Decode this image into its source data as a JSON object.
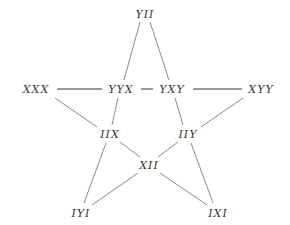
{
  "diagram": {
    "type": "star-graph",
    "nodes": [
      {
        "id": "YII",
        "label": "YII",
        "x": 145,
        "y": 14
      },
      {
        "id": "XXX",
        "label": "XXX",
        "x": 36,
        "y": 89
      },
      {
        "id": "YYX",
        "label": "YYX",
        "x": 121,
        "y": 89
      },
      {
        "id": "YXY",
        "label": "YXY",
        "x": 172,
        "y": 89
      },
      {
        "id": "XYY",
        "label": "XYY",
        "x": 261,
        "y": 89
      },
      {
        "id": "IIX",
        "label": "IIX",
        "x": 110,
        "y": 134
      },
      {
        "id": "IIY",
        "label": "IIY",
        "x": 188,
        "y": 134
      },
      {
        "id": "XII",
        "label": "XII",
        "x": 149,
        "y": 165
      },
      {
        "id": "IYI",
        "label": "IYI",
        "x": 81,
        "y": 213
      },
      {
        "id": "IXI",
        "label": "IXI",
        "x": 218,
        "y": 213
      }
    ],
    "edges": [
      {
        "from": "YII",
        "to": "YYX",
        "style": "thin"
      },
      {
        "from": "YII",
        "to": "YXY",
        "style": "thin"
      },
      {
        "from": "XXX",
        "to": "YYX",
        "style": "thick"
      },
      {
        "from": "YYX",
        "to": "YXY",
        "style": "thick"
      },
      {
        "from": "YXY",
        "to": "XYY",
        "style": "thick"
      },
      {
        "from": "YYX",
        "to": "IIX",
        "style": "thin"
      },
      {
        "from": "YXY",
        "to": "IIY",
        "style": "thin"
      },
      {
        "from": "XXX",
        "to": "IIX",
        "style": "thin"
      },
      {
        "from": "XYY",
        "to": "IIY",
        "style": "thin"
      },
      {
        "from": "IIX",
        "to": "XII",
        "style": "thin"
      },
      {
        "from": "IIY",
        "to": "XII",
        "style": "thin"
      },
      {
        "from": "IIX",
        "to": "IYI",
        "style": "thin"
      },
      {
        "from": "IIY",
        "to": "IXI",
        "style": "thin"
      },
      {
        "from": "XII",
        "to": "IYI",
        "style": "thin"
      },
      {
        "from": "XII",
        "to": "IXI",
        "style": "thin"
      }
    ]
  }
}
